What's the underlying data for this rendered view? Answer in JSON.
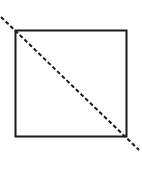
{
  "figure": {
    "name": "square-with-dashed-diagonal",
    "canvas": {
      "width": 142,
      "height": 181,
      "background_color": "#FFFFFF"
    },
    "shapes": {
      "square": {
        "label": "square",
        "x": 15.5,
        "y": 30.5,
        "width": 111,
        "height": 106,
        "stroke_color": "#1A1A1A",
        "stroke_width": 2,
        "fill_color": "#FFFFFF"
      },
      "diagonal": {
        "label": "dashed-diagonal-line",
        "x1": 1,
        "y1": 17,
        "x2": 139,
        "y2": 150,
        "stroke_color": "#1A1A1A",
        "stroke_width": 2,
        "dash_length": 4,
        "gap_length": 2.5,
        "style": "dashed",
        "direction": "top-left to bottom-right",
        "extends_beyond_square": true
      }
    }
  }
}
